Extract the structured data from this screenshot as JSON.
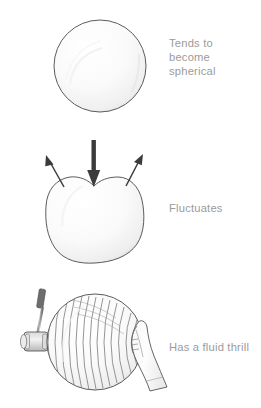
{
  "figure": {
    "background_color": "#ffffff",
    "caption_color": "#9b9b9b",
    "outline_color": "#4a4a4a",
    "arrow_color": "#3b3b3b",
    "fill_color": "#fbfbfb"
  },
  "panels": [
    {
      "id": "panel-spherical",
      "caption": "Tends to\nbecome\nspherical",
      "illustration": "sphere",
      "shapes": [
        "sphere-outline",
        "sphere-highlight"
      ]
    },
    {
      "id": "panel-fluctuates",
      "caption": "Fluctuates",
      "illustration": "deformed-sphere-with-arrows",
      "shapes": [
        "blob-outline",
        "down-arrow",
        "left-arrow",
        "right-arrow"
      ]
    },
    {
      "id": "panel-fluid-thrill",
      "caption": "Has a fluid thrill",
      "illustration": "sphere-with-hammer-and-hand",
      "shapes": [
        "sphere-outline",
        "wave-lines",
        "percussion-hammer",
        "examining-hand"
      ]
    }
  ]
}
